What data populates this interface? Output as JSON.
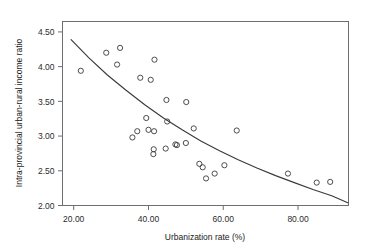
{
  "chart_data": {
    "type": "scatter",
    "title": "",
    "subtitle": "",
    "xlabel": "Urbanization rate (%)",
    "ylabel": "Intra-provincial urban-rural income ratio",
    "xlim": [
      17.0,
      93.5
    ],
    "ylim": [
      2.0,
      4.65
    ],
    "grid": false,
    "legend": null,
    "xticks": [
      20,
      40,
      60,
      80
    ],
    "xtick_labels": [
      "20.00",
      "40.00",
      "60.00",
      "80.00"
    ],
    "yticks": [
      2.0,
      2.5,
      3.0,
      3.5,
      4.0,
      4.5
    ],
    "ytick_labels": [
      "2.00",
      "2.50",
      "3.00",
      "3.50",
      "4.00",
      "4.50"
    ],
    "marker": "open-circle",
    "marker_color": "#3a3a3a",
    "points": [
      {
        "x": 21.9,
        "y": 3.94
      },
      {
        "x": 28.7,
        "y": 4.2
      },
      {
        "x": 32.4,
        "y": 4.27
      },
      {
        "x": 31.6,
        "y": 4.03
      },
      {
        "x": 41.6,
        "y": 4.1
      },
      {
        "x": 37.8,
        "y": 3.84
      },
      {
        "x": 40.6,
        "y": 3.81
      },
      {
        "x": 44.8,
        "y": 3.52
      },
      {
        "x": 50.1,
        "y": 3.49
      },
      {
        "x": 39.4,
        "y": 3.26
      },
      {
        "x": 45.0,
        "y": 3.21
      },
      {
        "x": 52.1,
        "y": 3.11
      },
      {
        "x": 63.6,
        "y": 3.08
      },
      {
        "x": 37.0,
        "y": 3.07
      },
      {
        "x": 35.7,
        "y": 2.98
      },
      {
        "x": 40.0,
        "y": 3.09
      },
      {
        "x": 41.5,
        "y": 3.07
      },
      {
        "x": 41.4,
        "y": 2.81
      },
      {
        "x": 41.3,
        "y": 2.74
      },
      {
        "x": 44.6,
        "y": 2.82
      },
      {
        "x": 47.2,
        "y": 2.88
      },
      {
        "x": 47.6,
        "y": 2.87
      },
      {
        "x": 50.0,
        "y": 2.9
      },
      {
        "x": 53.6,
        "y": 2.6
      },
      {
        "x": 54.5,
        "y": 2.55
      },
      {
        "x": 55.4,
        "y": 2.39
      },
      {
        "x": 57.7,
        "y": 2.46
      },
      {
        "x": 60.3,
        "y": 2.58
      },
      {
        "x": 77.3,
        "y": 2.46
      },
      {
        "x": 85.0,
        "y": 2.33
      },
      {
        "x": 88.6,
        "y": 2.34
      }
    ],
    "fit_line": {
      "type": "curve",
      "description": "decreasing fitted curve",
      "points": [
        {
          "x": 19.3,
          "y": 4.39
        },
        {
          "x": 24.0,
          "y": 4.13
        },
        {
          "x": 29.0,
          "y": 3.88
        },
        {
          "x": 34.0,
          "y": 3.66
        },
        {
          "x": 39.0,
          "y": 3.45
        },
        {
          "x": 44.0,
          "y": 3.26
        },
        {
          "x": 49.0,
          "y": 3.09
        },
        {
          "x": 54.0,
          "y": 2.93
        },
        {
          "x": 59.0,
          "y": 2.79
        },
        {
          "x": 64.0,
          "y": 2.66
        },
        {
          "x": 69.0,
          "y": 2.54
        },
        {
          "x": 74.0,
          "y": 2.43
        },
        {
          "x": 79.0,
          "y": 2.33
        },
        {
          "x": 84.0,
          "y": 2.23
        },
        {
          "x": 89.0,
          "y": 2.14
        },
        {
          "x": 93.3,
          "y": 2.04
        }
      ]
    }
  }
}
